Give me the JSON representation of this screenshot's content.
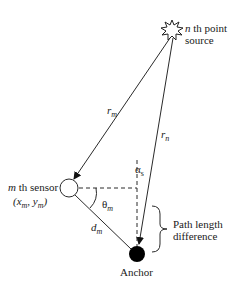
{
  "diagram": {
    "source_label": {
      "prefix": "n",
      "line1": " th point",
      "line2": "source"
    },
    "sensor_label": {
      "prefix": "m",
      "line1": " th sensor",
      "coords": "(x",
      "coord_sub_m": "m",
      "coord_sep": ", y",
      "coord_close": ")"
    },
    "r_m": {
      "base": "r",
      "sub": "m"
    },
    "r_n": {
      "base": "r",
      "sub": "n"
    },
    "alpha_s": {
      "base": "α",
      "sub": "s"
    },
    "theta_m": {
      "base": "θ",
      "sub": "m"
    },
    "d_m": {
      "base": "d",
      "sub": "m"
    },
    "path_length": {
      "line1": "Path length",
      "line2": "difference"
    },
    "anchor_label": "Anchor",
    "colors": {
      "line": "#2a2a2a",
      "anchor_fill": "#000000",
      "background": "#ffffff"
    },
    "points": {
      "source": [
        172,
        30
      ],
      "sensor": [
        69,
        188
      ],
      "anchor": [
        137,
        254
      ]
    }
  }
}
